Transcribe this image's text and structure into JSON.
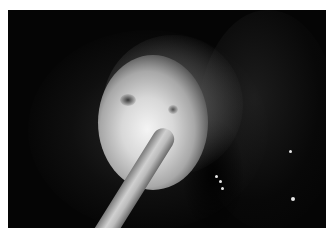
{
  "image": {
    "description": "Grayscale endoscopic photograph of a bright mass within a dark lumen with an instrument entering from below",
    "background_color": "#ffffff",
    "photo_background": "#050505",
    "elements": [
      {
        "name": "tissue-mass",
        "tone": "bright-white"
      },
      {
        "name": "instrument",
        "tone": "light-gray"
      },
      {
        "name": "lumen-wall",
        "tone": "dark-gray"
      }
    ]
  }
}
